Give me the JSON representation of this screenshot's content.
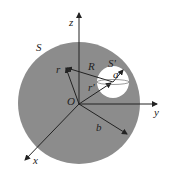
{
  "diagram": {
    "labels": {
      "z": "z",
      "y": "y",
      "x": "x",
      "S": "S",
      "S_prime": "S'",
      "O": "O",
      "r": "r",
      "R": "R",
      "r_prime": "r'",
      "a": "a",
      "b": "b"
    },
    "colors": {
      "sphere": "#8c8c8c",
      "cavity": "#ffffff",
      "line": "#222222"
    }
  }
}
